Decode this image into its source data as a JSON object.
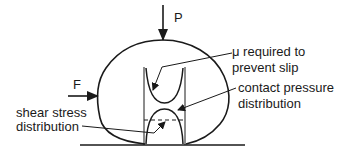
{
  "diagram": {
    "forces": {
      "normal_load": "P",
      "tangential_force": "F"
    },
    "annotations": {
      "mu_line1": "μ required to",
      "mu_line2": "prevent slip",
      "pressure_line1": "contact pressure",
      "pressure_line2": "distribution",
      "shear_line1": "shear stress",
      "shear_line2": "distribution"
    },
    "colors": {
      "ink": "#1a1a1a",
      "background": "#ffffff"
    }
  }
}
